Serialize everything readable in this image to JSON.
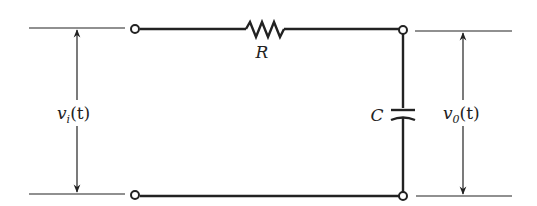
{
  "diagram": {
    "type": "RC low-pass circuit",
    "components": {
      "resistor": {
        "label": "R"
      },
      "capacitor": {
        "label": "C"
      }
    },
    "input_voltage": {
      "symbol": "v",
      "subscript": "i",
      "arg": "(t)"
    },
    "output_voltage": {
      "symbol": "v",
      "subscript": "0",
      "arg": "(t)"
    },
    "colors": {
      "line": "#222222",
      "background": "#ffffff"
    }
  }
}
